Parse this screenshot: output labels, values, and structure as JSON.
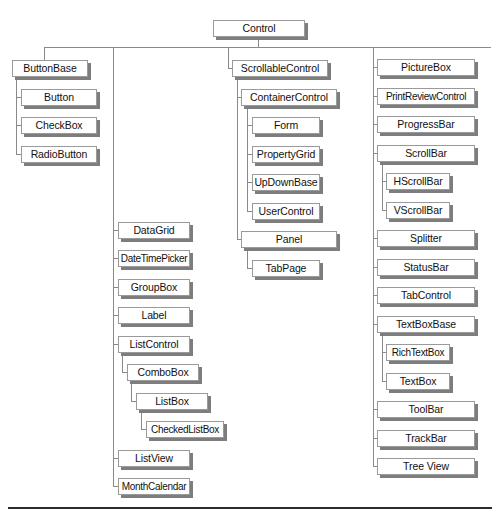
{
  "diagram": {
    "root": "Control",
    "nodes": [
      {
        "id": "control",
        "label": "Control",
        "parent": null,
        "x": 213,
        "y": 20,
        "w": 92
      },
      {
        "id": "buttonbase",
        "label": "ButtonBase",
        "parent": "control",
        "x": 12,
        "y": 60,
        "w": 76
      },
      {
        "id": "button",
        "label": "Button",
        "parent": "buttonbase",
        "x": 21,
        "y": 89,
        "w": 76
      },
      {
        "id": "checkbox",
        "label": "CheckBox",
        "parent": "buttonbase",
        "x": 21,
        "y": 117,
        "w": 76
      },
      {
        "id": "radiobutton",
        "label": "RadioButton",
        "parent": "buttonbase",
        "x": 21,
        "y": 146,
        "w": 76
      },
      {
        "id": "scrollablecontrol",
        "label": "ScrollableControl",
        "parent": "control",
        "x": 232,
        "y": 60,
        "w": 96
      },
      {
        "id": "containercontrol",
        "label": "ContainerControl",
        "parent": "scrollablecontrol",
        "x": 241,
        "y": 89,
        "w": 96
      },
      {
        "id": "form",
        "label": "Form",
        "parent": "containercontrol",
        "x": 252,
        "y": 117,
        "w": 68
      },
      {
        "id": "propertygrid",
        "label": "PropertyGrid",
        "parent": "containercontrol",
        "x": 252,
        "y": 146,
        "w": 68
      },
      {
        "id": "updownbase",
        "label": "UpDownBase",
        "parent": "containercontrol",
        "x": 252,
        "y": 174,
        "w": 68
      },
      {
        "id": "usercontrol",
        "label": "UserControl",
        "parent": "containercontrol",
        "x": 252,
        "y": 203,
        "w": 68
      },
      {
        "id": "panel",
        "label": "Panel",
        "parent": "scrollablecontrol",
        "x": 241,
        "y": 231,
        "w": 96
      },
      {
        "id": "tabpage",
        "label": "TabPage",
        "parent": "panel",
        "x": 252,
        "y": 260,
        "w": 68
      },
      {
        "id": "datagrid",
        "label": "DataGrid",
        "parent": "control",
        "x": 118,
        "y": 222,
        "w": 72
      },
      {
        "id": "datetimepicker",
        "label": "DateTimePicker",
        "parent": "control",
        "x": 118,
        "y": 250,
        "w": 72
      },
      {
        "id": "groupbox",
        "label": "GroupBox",
        "parent": "control",
        "x": 118,
        "y": 279,
        "w": 72
      },
      {
        "id": "label",
        "label": "Label",
        "parent": "control",
        "x": 118,
        "y": 307,
        "w": 72
      },
      {
        "id": "listcontrol",
        "label": "ListControl",
        "parent": "control",
        "x": 118,
        "y": 336,
        "w": 72
      },
      {
        "id": "combobox",
        "label": "ComboBox",
        "parent": "listcontrol",
        "x": 127,
        "y": 364,
        "w": 72
      },
      {
        "id": "listbox",
        "label": "ListBox",
        "parent": "combobox",
        "x": 136,
        "y": 393,
        "w": 72
      },
      {
        "id": "checkedlistbox",
        "label": "CheckedListBox",
        "parent": "listbox",
        "x": 146,
        "y": 421,
        "w": 78
      },
      {
        "id": "listview",
        "label": "ListView",
        "parent": "control",
        "x": 118,
        "y": 450,
        "w": 72
      },
      {
        "id": "monthcalendar",
        "label": "MonthCalendar",
        "parent": "control",
        "x": 118,
        "y": 478,
        "w": 72
      },
      {
        "id": "picturebox",
        "label": "PictureBox",
        "parent": "control",
        "x": 377,
        "y": 59,
        "w": 98
      },
      {
        "id": "printreviewcontrol",
        "label": "PrintReviewControl",
        "parent": "control",
        "x": 377,
        "y": 88,
        "w": 98
      },
      {
        "id": "progressbar",
        "label": "ProgressBar",
        "parent": "control",
        "x": 377,
        "y": 116,
        "w": 98
      },
      {
        "id": "scrollbar",
        "label": "ScrollBar",
        "parent": "control",
        "x": 377,
        "y": 145,
        "w": 98
      },
      {
        "id": "hscrollbar",
        "label": "HScrollBar",
        "parent": "scrollbar",
        "x": 386,
        "y": 173,
        "w": 64
      },
      {
        "id": "vscrollbar",
        "label": "VScrollBar",
        "parent": "scrollbar",
        "x": 386,
        "y": 202,
        "w": 64
      },
      {
        "id": "splitter",
        "label": "Splitter",
        "parent": "control",
        "x": 377,
        "y": 230,
        "w": 98
      },
      {
        "id": "statusbar",
        "label": "StatusBar",
        "parent": "control",
        "x": 377,
        "y": 259,
        "w": 98
      },
      {
        "id": "tabcontrol",
        "label": "TabControl",
        "parent": "control",
        "x": 377,
        "y": 287,
        "w": 98
      },
      {
        "id": "textboxbase",
        "label": "TextBoxBase",
        "parent": "control",
        "x": 377,
        "y": 316,
        "w": 98
      },
      {
        "id": "richtextbox",
        "label": "RichTextBox",
        "parent": "textboxbase",
        "x": 386,
        "y": 344,
        "w": 64
      },
      {
        "id": "textbox",
        "label": "TextBox",
        "parent": "textboxbase",
        "x": 386,
        "y": 373,
        "w": 64
      },
      {
        "id": "toolbar",
        "label": "ToolBar",
        "parent": "control",
        "x": 377,
        "y": 401,
        "w": 98
      },
      {
        "id": "trackbar",
        "label": "TrackBar",
        "parent": "control",
        "x": 377,
        "y": 430,
        "w": 98
      },
      {
        "id": "treeview",
        "label": "Tree View",
        "parent": "control",
        "x": 377,
        "y": 458,
        "w": 98
      }
    ]
  },
  "colors": {
    "box_border": "#9a9a9a",
    "box_shadow": "#7d7d7d",
    "connector": "#8a8a8a",
    "bottom_rule": "#2b2b2b"
  }
}
